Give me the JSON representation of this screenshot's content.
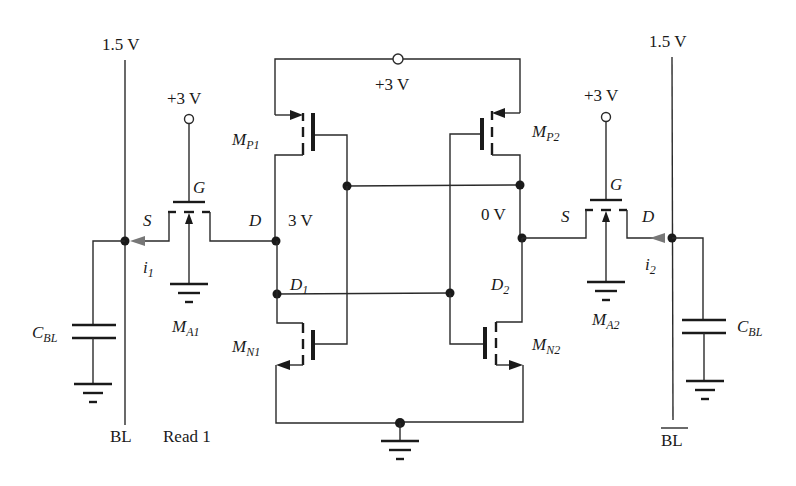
{
  "diagram": {
    "type": "circuit-schematic",
    "supply_labels": {
      "bitline_left_voltage": "1.5 V",
      "bitline_right_voltage": "1.5 V",
      "access_gate_left": "+3 V",
      "access_gate_right": "+3 V",
      "latch_supply": "+3 V"
    },
    "node_labels": {
      "left_storage_node_voltage": "3 V",
      "right_storage_node_voltage": "0 V",
      "d1": "D",
      "d1_sub": "1",
      "d2": "D",
      "d2_sub": "2"
    },
    "transistors": {
      "mp1": {
        "name": "M",
        "sub": "P1"
      },
      "mp2": {
        "name": "M",
        "sub": "P2"
      },
      "mn1": {
        "name": "M",
        "sub": "N1"
      },
      "mn2": {
        "name": "M",
        "sub": "N2"
      },
      "ma1": {
        "name": "M",
        "sub": "A1"
      },
      "ma2": {
        "name": "M",
        "sub": "A2"
      }
    },
    "terminal_labels": {
      "source": "S",
      "drain": "D",
      "gate": "G"
    },
    "currents": {
      "i1": {
        "name": "i",
        "sub": "1"
      },
      "i2": {
        "name": "i",
        "sub": "2"
      }
    },
    "capacitors": {
      "left": {
        "name": "C",
        "sub": "BL"
      },
      "right": {
        "name": "C",
        "sub": "BL"
      }
    },
    "bitlines": {
      "left": "BL",
      "right": "BL",
      "right_overbar": true
    },
    "caption": "Read 1"
  }
}
